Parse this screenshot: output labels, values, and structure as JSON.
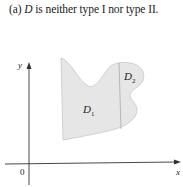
{
  "figure": {
    "caption_prefix": "(a) ",
    "caption_var": "D",
    "caption_rest": " is neither type I nor type II.",
    "axes": {
      "x_label": "x",
      "y_label": "y",
      "origin_label": "0"
    },
    "regions": [
      {
        "label_main": "D",
        "label_sub": "1"
      },
      {
        "label_main": "D",
        "label_sub": "2"
      }
    ],
    "colors": {
      "region_fill": "#e6e6e6",
      "region_stroke": "#b5b5b5",
      "axis": "#333333"
    }
  }
}
